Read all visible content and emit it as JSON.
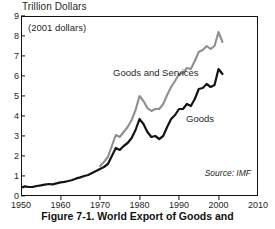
{
  "figure": {
    "axis_title": "Trillion Dollars",
    "units_note": "(2001 dollars)",
    "source": "Source: IMF",
    "caption": "Figure 7-1.  World Export of Goods and"
  },
  "labels": {
    "goods_and_services": "Goods and Services",
    "goods": "Goods"
  },
  "colors": {
    "goods_line": "#141414",
    "goods_and_services_line": "#8f8f8f",
    "frame": "#111111",
    "text": "#1f1f1f",
    "background": "#ffffff"
  },
  "chart_data": {
    "type": "line",
    "title": "Trillion Dollars",
    "subtitle": "(2001 dollars)",
    "xlabel": "",
    "ylabel": "Trillion Dollars",
    "xlim": [
      1950,
      2010
    ],
    "ylim": [
      0,
      9
    ],
    "xticks": [
      1950,
      1960,
      1970,
      1980,
      1990,
      2000,
      2010
    ],
    "yticks": [
      0,
      1,
      2,
      3,
      4,
      5,
      6,
      7,
      8,
      9
    ],
    "xtick_labels": [
      "1950",
      "1960",
      "1970",
      "1980",
      "1990",
      "2000",
      "2010"
    ],
    "ytick_labels": [
      "0",
      "1",
      "2",
      "3",
      "4",
      "5",
      "6",
      "7",
      "8",
      "9"
    ],
    "grid": false,
    "legend": "inline-annotations",
    "annotations": [
      {
        "text": "Goods and Services",
        "x": 1980,
        "y": 6.3
      },
      {
        "text": "Goods",
        "x": 1999,
        "y": 4.2
      },
      {
        "text": "Source: IMF",
        "x": 2006,
        "y": 0.85
      },
      {
        "text": "(2001 dollars)",
        "x": 1952,
        "y": 8.45
      }
    ],
    "series": [
      {
        "name": "Goods and Services",
        "color": "#8f8f8f",
        "x": [
          1970,
          1971,
          1972,
          1973,
          1974,
          1975,
          1976,
          1977,
          1978,
          1979,
          1980,
          1981,
          1982,
          1983,
          1984,
          1985,
          1986,
          1987,
          1988,
          1989,
          1990,
          1991,
          1992,
          1993,
          1994,
          1995,
          1996,
          1997,
          1998,
          1999,
          2000,
          2001
        ],
        "values": [
          1.5,
          1.7,
          1.95,
          2.5,
          3.05,
          2.95,
          3.2,
          3.45,
          3.8,
          4.3,
          5.0,
          4.75,
          4.4,
          4.25,
          4.35,
          4.35,
          4.6,
          5.05,
          5.45,
          5.75,
          6.1,
          6.15,
          6.4,
          6.35,
          6.75,
          7.2,
          7.3,
          7.5,
          7.35,
          7.5,
          8.2,
          7.7
        ]
      },
      {
        "name": "Goods",
        "color": "#141414",
        "x": [
          1950,
          1951,
          1952,
          1953,
          1954,
          1955,
          1956,
          1957,
          1958,
          1959,
          1960,
          1961,
          1962,
          1963,
          1964,
          1965,
          1966,
          1967,
          1968,
          1969,
          1970,
          1971,
          1972,
          1973,
          1974,
          1975,
          1976,
          1977,
          1978,
          1979,
          1980,
          1981,
          1982,
          1983,
          1984,
          1985,
          1986,
          1987,
          1988,
          1989,
          1990,
          1991,
          1992,
          1993,
          1994,
          1995,
          1996,
          1997,
          1998,
          1999,
          2000,
          2001
        ],
        "values": [
          0.42,
          0.48,
          0.45,
          0.46,
          0.5,
          0.53,
          0.57,
          0.6,
          0.58,
          0.63,
          0.68,
          0.71,
          0.75,
          0.8,
          0.88,
          0.93,
          1.0,
          1.05,
          1.15,
          1.25,
          1.35,
          1.45,
          1.6,
          2.0,
          2.4,
          2.3,
          2.5,
          2.65,
          2.9,
          3.3,
          3.85,
          3.6,
          3.2,
          2.95,
          3.0,
          2.85,
          3.0,
          3.45,
          3.85,
          4.05,
          4.35,
          4.35,
          4.6,
          4.5,
          4.85,
          5.35,
          5.4,
          5.6,
          5.45,
          5.55,
          6.35,
          6.1
        ]
      }
    ]
  }
}
